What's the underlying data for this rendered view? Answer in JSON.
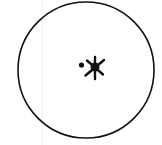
{
  "diagram": {
    "title": "",
    "background": "#ffffff",
    "stroke_color": "#111111",
    "faint_line_color": "#eeeeee",
    "outer_circle": {
      "cx": 86,
      "cy": 70,
      "r": 68,
      "stroke_width": 1.6
    },
    "faint_vertical_line": {
      "x": 42,
      "y1": 0,
      "y2": 145
    },
    "central_star": {
      "cx": 95,
      "cy": 67,
      "core_radius": 4.5,
      "ray_count": 6
    },
    "small_dot": {
      "cx": 81.5,
      "cy": 65,
      "r": 2.6
    }
  }
}
